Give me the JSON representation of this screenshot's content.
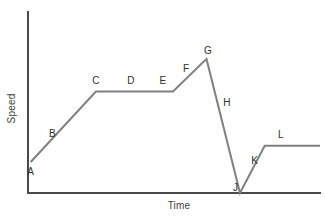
{
  "chart_data": {
    "type": "line",
    "title": "",
    "xlabel": "Time",
    "ylabel": "Speed",
    "grid": false,
    "legend": null,
    "axes": {
      "x_axis_shown": true,
      "y_axis_shown": true,
      "ticks": [],
      "xlim": [
        0,
        100
      ],
      "ylim": [
        0,
        100
      ]
    },
    "series": [
      {
        "name": "speed-time curve",
        "color": "#808080",
        "points": [
          {
            "x": 0.6,
            "y": 20.0
          },
          {
            "x": 23.0,
            "y": 65.5
          },
          {
            "x": 49.5,
            "y": 65.5
          },
          {
            "x": 61.0,
            "y": 86.5
          },
          {
            "x": 72.5,
            "y": 0.0
          },
          {
            "x": 81.0,
            "y": 30.5
          },
          {
            "x": 100.0,
            "y": 30.5
          }
        ]
      }
    ],
    "segment_labels": [
      {
        "label": "A",
        "x": 0.6,
        "y": 14.5,
        "role": "start-point"
      },
      {
        "label": "B",
        "x": 8.0,
        "y": 38.5,
        "role": "acceleration-segment"
      },
      {
        "label": "C",
        "x": 23.0,
        "y": 73.0,
        "role": "top-of-acceleration"
      },
      {
        "label": "D",
        "x": 35.0,
        "y": 73.0,
        "role": "constant-speed-segment"
      },
      {
        "label": "E",
        "x": 46.0,
        "y": 73.0,
        "role": "end-of-constant-speed"
      },
      {
        "label": "F",
        "x": 54.0,
        "y": 80.5,
        "role": "second-acceleration-segment"
      },
      {
        "label": "G",
        "x": 61.5,
        "y": 92.0,
        "role": "peak-speed"
      },
      {
        "label": "H",
        "x": 68.0,
        "y": 58.5,
        "role": "deceleration-segment"
      },
      {
        "label": "J",
        "x": 71.0,
        "y": 4.0,
        "role": "stop-point"
      },
      {
        "label": "K",
        "x": 77.5,
        "y": 21.0,
        "role": "re-acceleration-segment"
      },
      {
        "label": "L",
        "x": 86.5,
        "y": 38.0,
        "role": "final-constant-speed"
      }
    ]
  },
  "colors": {
    "curve": "#808080",
    "axis": "#4a4a4a",
    "label_text": "#2e2e2e",
    "background": "#ffffff"
  }
}
